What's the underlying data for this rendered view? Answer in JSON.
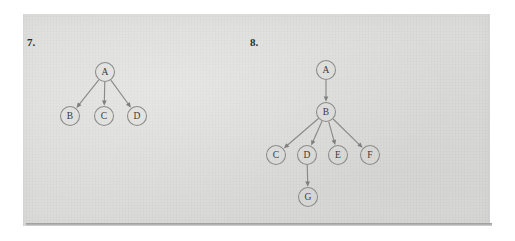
{
  "page": {
    "background_color": "#ffffff",
    "scan_color": "#dcdcda",
    "ink_color": "#8b8b8b",
    "text_color": "#2b2b2b"
  },
  "problems": [
    {
      "number_label": "7.",
      "nodes": [
        {
          "id": "A",
          "label": "A",
          "x": 105,
          "y": 72,
          "r": 9.5
        },
        {
          "id": "B",
          "label": "B",
          "x": 70,
          "y": 116,
          "r": 9.5
        },
        {
          "id": "C",
          "label": "C",
          "x": 104,
          "y": 116,
          "r": 9.5
        },
        {
          "id": "D",
          "label": "D",
          "x": 137,
          "y": 116,
          "r": 9.5
        }
      ],
      "edges": [
        {
          "from": "A",
          "to": "B",
          "directed": true
        },
        {
          "from": "A",
          "to": "C",
          "directed": true
        },
        {
          "from": "A",
          "to": "D",
          "directed": true
        }
      ]
    },
    {
      "number_label": "8.",
      "nodes": [
        {
          "id": "A",
          "label": "A",
          "x": 326,
          "y": 70,
          "r": 9.5
        },
        {
          "id": "B",
          "label": "B",
          "x": 326,
          "y": 112,
          "r": 9.5
        },
        {
          "id": "C",
          "label": "C",
          "x": 276,
          "y": 155,
          "r": 9.5
        },
        {
          "id": "D",
          "label": "D",
          "x": 307,
          "y": 155,
          "r": 9.5
        },
        {
          "id": "E",
          "label": "E",
          "x": 338,
          "y": 155,
          "r": 9.5
        },
        {
          "id": "F",
          "label": "F",
          "x": 370,
          "y": 155,
          "r": 9.5
        },
        {
          "id": "G",
          "label": "G",
          "x": 308,
          "y": 197,
          "r": 9.5
        }
      ],
      "edges": [
        {
          "from": "A",
          "to": "B",
          "directed": true
        },
        {
          "from": "B",
          "to": "C",
          "directed": true
        },
        {
          "from": "B",
          "to": "D",
          "directed": true
        },
        {
          "from": "B",
          "to": "E",
          "directed": true
        },
        {
          "from": "B",
          "to": "F",
          "directed": true
        },
        {
          "from": "D",
          "to": "G",
          "directed": true
        }
      ]
    }
  ]
}
